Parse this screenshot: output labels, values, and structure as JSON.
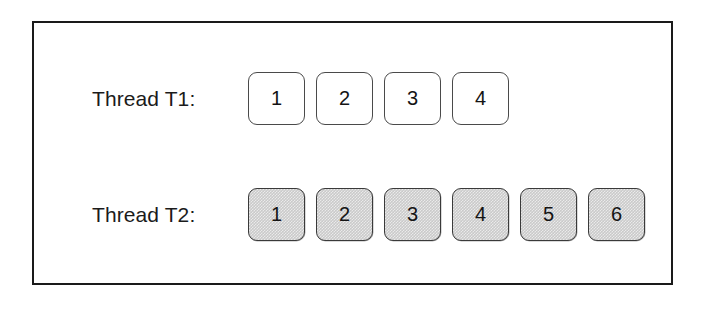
{
  "diagram": {
    "rows": [
      {
        "label": "Thread T1:",
        "style": "empty",
        "slots": [
          "1",
          "2",
          "3",
          "4"
        ]
      },
      {
        "label": "Thread T2:",
        "style": "filled",
        "slots": [
          "1",
          "2",
          "3",
          "4",
          "5",
          "6"
        ]
      }
    ],
    "colors": {
      "frame_border": "#1a1a1a",
      "background": "#ffffff",
      "slot_empty_fill": "#ffffff",
      "slot_filled_fill": "#cacaca",
      "slot_border": "#3a3a3a",
      "text": "#141414"
    }
  }
}
